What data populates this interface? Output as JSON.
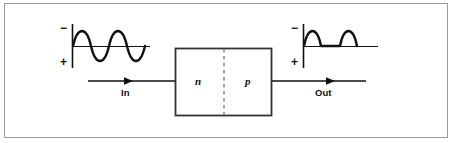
{
  "figure": {
    "background_color": "#ffffff",
    "border_color": "#9a9a9a",
    "stroke_color": "#111111"
  },
  "input_waveform": {
    "name": "input-sine-wave",
    "polarity_top": "−",
    "polarity_bottom": "+",
    "axis_origin": {
      "x": 72,
      "y": 46
    },
    "baseline_end_x": 150,
    "axis_top_y": 24,
    "axis_bottom_y": 68,
    "shape": "full sine, 2 cycles",
    "cycles": 2,
    "amplitude": 20,
    "clipped": false
  },
  "output_waveform": {
    "name": "output-rectified-wave",
    "polarity_top": "−",
    "polarity_bottom": "+",
    "axis_origin": {
      "x": 303,
      "y": 46
    },
    "baseline_end_x": 378,
    "axis_top_y": 24,
    "axis_bottom_y": 68,
    "shape": "half-wave rectified, 2 positive humps",
    "cycles": 2,
    "amplitude": 20,
    "clipped": true
  },
  "diode": {
    "name": "pn-junction-block",
    "box": {
      "x": 175,
      "y": 48,
      "width": 97,
      "height": 68
    },
    "junction_x": 224,
    "junction_style": "dashed",
    "regions": [
      {
        "label": "n",
        "name": "n-region-label",
        "center_x": 199
      },
      {
        "label": "p",
        "name": "p-region-label",
        "center_x": 248
      }
    ]
  },
  "input_flow": {
    "label": "In",
    "line_y": 81,
    "start_x": 88,
    "arrow_x": 131,
    "end_x": 175,
    "label_x": 110,
    "label_y": 88
  },
  "output_flow": {
    "label": "Out",
    "line_y": 81,
    "start_x": 272,
    "arrow_x": 333,
    "end_x": 366,
    "label_x": 325,
    "label_y": 88
  }
}
